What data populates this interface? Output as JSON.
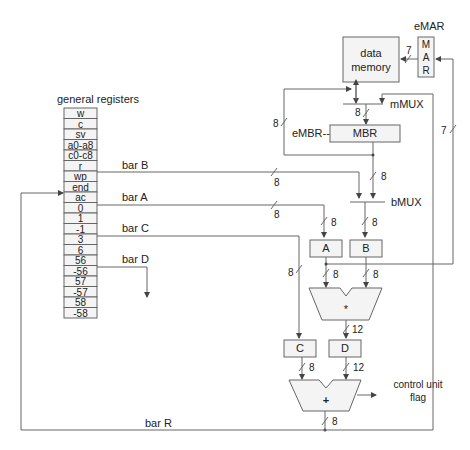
{
  "title": "general registers",
  "registers": [
    "w",
    "c",
    "sv",
    "a0-a8",
    "c0-c8",
    "r",
    "wp",
    "end",
    "ac",
    "0",
    "1",
    "-1",
    "3",
    "6",
    "56",
    "-56",
    "57",
    "-57",
    "58",
    "-58"
  ],
  "buses": {
    "barB": "bar B",
    "barA": "bar A",
    "barC": "bar C",
    "barD": "bar D",
    "barR": "bar R"
  },
  "blocks": {
    "data_memory_line1": "data",
    "data_memory_line2": "memory",
    "emar_label": "eMAR",
    "mar_letters": [
      "M",
      "A",
      "R"
    ],
    "mmux": "mMUX",
    "mbr": "MBR",
    "embr_label": "eMBR--",
    "bmux": "bMUX",
    "reg_a": "A",
    "reg_b": "B",
    "reg_c": "C",
    "reg_d": "D",
    "multiplier": "*",
    "adder": "+",
    "control_line1": "control unit",
    "control_line2": "flag"
  },
  "widths": {
    "mar_to_mem": "7",
    "mem_to_mbr": "8",
    "mbr_feedback": "8",
    "mar_feedback": "7",
    "barB": "8",
    "barA": "8",
    "mbr_to_bmux": "8",
    "barA_to_A": "8",
    "bmux_to_B": "8",
    "barC": "8",
    "A_to_mul": "8",
    "B_to_mul": "8",
    "mul_to_D": "12",
    "C_to_add": "8",
    "D_to_add": "12",
    "add_out": "8"
  }
}
